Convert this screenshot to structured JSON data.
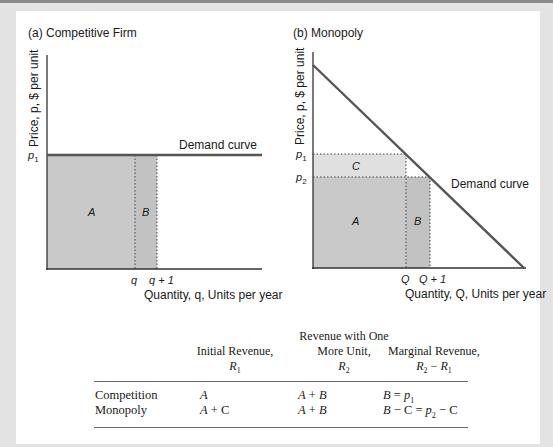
{
  "panel_a": {
    "title": "(a) Competitive Firm",
    "y_axis_label": "Price, p, $ per unit",
    "x_axis_label": "Quantity, q, Units per year",
    "price_tick": "p1",
    "qty_ticks": [
      "q",
      "q + 1"
    ],
    "curve_label": "Demand curve",
    "region_labels": [
      "A",
      "B"
    ]
  },
  "panel_b": {
    "title": "(b) Monopoly",
    "y_axis_label": "Price, p, $ per unit",
    "x_axis_label": "Quantity, Q, Units per year",
    "price_ticks": [
      "p1",
      "p2"
    ],
    "qty_ticks": [
      "Q",
      "Q + 1"
    ],
    "curve_label": "Demand curve",
    "region_labels": [
      "C",
      "A",
      "B"
    ]
  },
  "table": {
    "headers": [
      {
        "line1": "Initial Revenue,",
        "line2": "R1"
      },
      {
        "line0": "Revenue with One",
        "line1": "More Unit,",
        "line2": "R2"
      },
      {
        "line1": "Marginal Revenue,",
        "line2": "R2 − R1"
      }
    ],
    "rows": [
      {
        "label": "Competition",
        "r1": "A",
        "r2": "A + B",
        "mr": "B = p1"
      },
      {
        "label": "Monopoly",
        "r1": "A + C",
        "r2": "A + B",
        "mr": "B − C = p2 − C"
      }
    ]
  },
  "colors": {
    "frame": "#e3e3e3",
    "panel": "#ffffff",
    "shade_dark": "#c8c8c8",
    "shade_light": "#dedede",
    "line": "#555555"
  }
}
